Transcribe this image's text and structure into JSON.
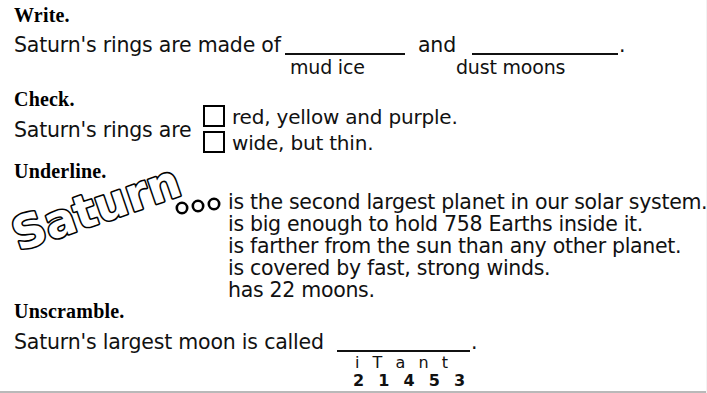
{
  "worksheet": {
    "topic": "Saturn",
    "sections": [
      {
        "heading": "Write.",
        "prompt_prefix": "Saturn's rings are made of",
        "conjunction": "and",
        "period": ".",
        "blank1_options": "mud     ice",
        "blank2_options": "dust    moons"
      },
      {
        "heading": "Check.",
        "prompt": "Saturn's rings are",
        "options": [
          "red, yellow and purple.",
          "wide, but thin."
        ]
      },
      {
        "heading": "Underline.",
        "wordart": "Saturn",
        "wordart_ellipsis": "ooo",
        "facts": [
          "is the second largest planet in our solar system.",
          "is big enough to hold 758 Earths inside it.",
          "is farther from the sun than any other planet.",
          "is covered by fast, strong winds.",
          "has 22 moons."
        ]
      },
      {
        "heading": "Unscramble.",
        "prompt": "Saturn's largest moon is called",
        "period": ".",
        "scrambled_letters": "i  T  a  n  t",
        "scrambled_order": "2  1  4  5  3"
      }
    ]
  },
  "colors": {
    "ink": "#111111",
    "paper": "#ffffff",
    "scan_edge": "#b9b9b9"
  }
}
